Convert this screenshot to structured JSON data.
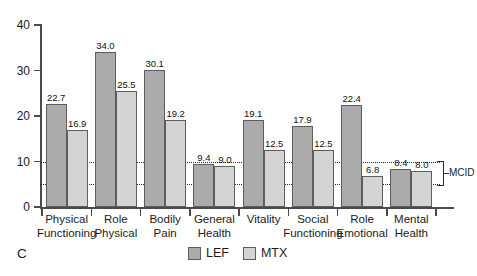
{
  "panel": {
    "letter": "C"
  },
  "legend": {
    "position": "bottom-center",
    "items": [
      {
        "label": "LEF",
        "color": "#ababab"
      },
      {
        "label": "MTX",
        "color": "#d4d4d4"
      }
    ]
  },
  "annotations": {
    "mcid_label": "MCID",
    "mcid_upper": 10,
    "mcid_lower": 5
  },
  "axis": {
    "y_ticks": [
      "0",
      "10",
      "20",
      "30",
      "40"
    ],
    "y_values": [
      0,
      10,
      20,
      30,
      40
    ]
  },
  "chart_data": {
    "type": "bar",
    "title": "",
    "subtitle": "",
    "xlabel": "",
    "ylabel": "",
    "ylim": [
      0,
      40
    ],
    "yticks": [
      0,
      10,
      20,
      30,
      40
    ],
    "grid": "dotted horizontal lines at y=10 and y=5 (MCID band)",
    "legend_position": "bottom-center",
    "categories": [
      "Physical Functioning",
      "Role Physical",
      "Bodily Pain",
      "General Health",
      "Vitality",
      "Social Functioning",
      "Role Emotional",
      "Mental Health"
    ],
    "category_lines": [
      [
        "Physical",
        "Functioning"
      ],
      [
        "Role",
        "Physical"
      ],
      [
        "Bodily",
        "Pain"
      ],
      [
        "General",
        "Health"
      ],
      [
        "Vitality",
        ""
      ],
      [
        "Social",
        "Functioning"
      ],
      [
        "Role",
        "Emotional"
      ],
      [
        "Mental",
        "Health"
      ]
    ],
    "series": [
      {
        "name": "LEF",
        "color": "#ababab",
        "values": [
          22.7,
          34.0,
          30.1,
          9.4,
          19.1,
          17.9,
          22.4,
          8.4
        ],
        "labels": [
          "22.7",
          "34.0",
          "30.1",
          "9.4",
          "19.1",
          "17.9",
          "22.4",
          "8.4"
        ]
      },
      {
        "name": "MTX",
        "color": "#d4d4d4",
        "values": [
          16.9,
          25.5,
          19.2,
          9.0,
          12.5,
          12.5,
          6.8,
          8.0
        ],
        "labels": [
          "16.9",
          "25.5",
          "19.2",
          "9.0",
          "12.5",
          "12.5",
          "6.8",
          "8.0"
        ]
      }
    ],
    "annotations": [
      {
        "text": "MCID",
        "type": "bracket",
        "y_range": [
          5,
          10
        ]
      }
    ]
  }
}
